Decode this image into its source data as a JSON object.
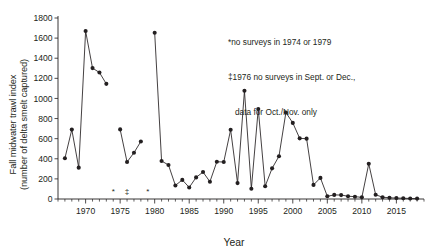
{
  "chart_data": {
    "type": "line",
    "title": "",
    "xlabel": "Year",
    "ylabel": "Fall midwater trawl index (number of delta smelt captured)",
    "ylabel_line1": "Fall midwater trawl index",
    "ylabel_line2": "(number of delta smelt captured)",
    "xlim": [
      1966,
      2019
    ],
    "ylim": [
      0,
      1800
    ],
    "ytick_step": 200,
    "xtick_step": 5,
    "grid": false,
    "legend": "none",
    "marker": "filled-circle",
    "line_color": "#231f20",
    "marker_color": "#231f20",
    "yticks": [
      0,
      200,
      400,
      600,
      800,
      1000,
      1200,
      1400,
      1600,
      1800
    ],
    "ytick_labels": [
      "0",
      "200",
      "400",
      "600",
      "800",
      "1000",
      "1200",
      "1400",
      "1600",
      "1800"
    ],
    "xticks": [
      1970,
      1975,
      1980,
      1985,
      1990,
      1995,
      2000,
      2005,
      2010,
      2015
    ],
    "xtick_labels": [
      "1970",
      "1975",
      "1980",
      "1985",
      "1990",
      "1995",
      "2000",
      "2005",
      "2010",
      "2015"
    ],
    "x": [
      1967,
      1968,
      1969,
      1970,
      1971,
      1972,
      1973,
      1975,
      1976,
      1977,
      1978,
      1980,
      1981,
      1982,
      1983,
      1984,
      1985,
      1986,
      1987,
      1988,
      1989,
      1990,
      1991,
      1992,
      1993,
      1994,
      1995,
      1996,
      1997,
      1998,
      1999,
      2000,
      2001,
      2002,
      2003,
      2004,
      2005,
      2006,
      2007,
      2008,
      2009,
      2010,
      2011,
      2012,
      2013,
      2014,
      2015,
      2016,
      2017,
      2018
    ],
    "values": [
      405,
      690,
      312,
      1670,
      1302,
      1258,
      1145,
      692,
      368,
      460,
      572,
      1654,
      378,
      338,
      135,
      190,
      115,
      215,
      268,
      172,
      370,
      368,
      688,
      158,
      1076,
      102,
      895,
      127,
      305,
      425,
      860,
      757,
      603,
      600,
      140,
      210,
      27,
      41,
      39,
      28,
      23,
      17,
      350,
      42,
      18,
      12,
      9,
      8,
      5,
      4
    ],
    "missing_years": [
      1974,
      1979
    ],
    "markers_on_axis": [
      {
        "year": 1974,
        "symbol": "*"
      },
      {
        "year": 1976,
        "symbol": "‡"
      },
      {
        "year": 1979,
        "symbol": "*"
      }
    ],
    "annotation_lines": [
      "*no surveys in 1974 or 1979",
      "‡1976 no surveys in Sept. or Dec.,",
      "data for Oct./Nov. only"
    ]
  }
}
